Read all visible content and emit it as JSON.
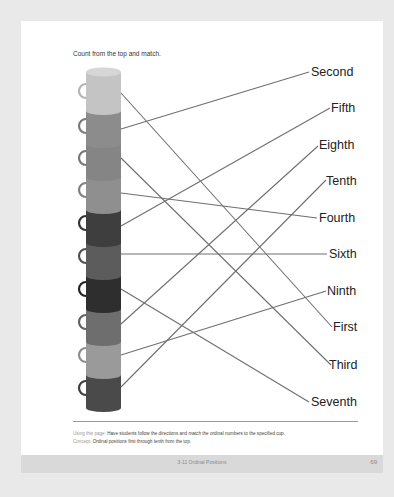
{
  "page": {
    "instruction": "Count from the top and match.",
    "cups": [
      {
        "position": 1,
        "color": "#c4c4c4"
      },
      {
        "position": 2,
        "color": "#8c8c8c"
      },
      {
        "position": 3,
        "color": "#858585"
      },
      {
        "position": 4,
        "color": "#8f8f8f"
      },
      {
        "position": 5,
        "color": "#3e3e3e"
      },
      {
        "position": 6,
        "color": "#5c5c5c"
      },
      {
        "position": 7,
        "color": "#2e2e2e"
      },
      {
        "position": 8,
        "color": "#6e6e6e"
      },
      {
        "position": 9,
        "color": "#9a9a9a"
      },
      {
        "position": 10,
        "color": "#4a4a4a"
      }
    ],
    "labels": [
      "Second",
      "Fifth",
      "Eighth",
      "Tenth",
      "Fourth",
      "Sixth",
      "Ninth",
      "First",
      "Third",
      "Seventh"
    ],
    "matches": [
      {
        "cup": 1,
        "label": "First"
      },
      {
        "cup": 2,
        "label": "Second"
      },
      {
        "cup": 3,
        "label": "Third"
      },
      {
        "cup": 4,
        "label": "Fourth"
      },
      {
        "cup": 5,
        "label": "Fifth"
      },
      {
        "cup": 6,
        "label": "Sixth"
      },
      {
        "cup": 7,
        "label": "Seventh"
      },
      {
        "cup": 8,
        "label": "Eighth"
      },
      {
        "cup": 9,
        "label": "Ninth"
      },
      {
        "cup": 10,
        "label": "Tenth"
      }
    ],
    "notes": {
      "using_key": "Using this page:",
      "using_text": " Have students follow the directions and match the ordinal numbers to the specified cup.",
      "concept_key": "Concept:",
      "concept_text": " Ordinal positions first through tenth from the top."
    }
  },
  "footer": {
    "title": "3-11 Ordinal Positions",
    "page_number": "69"
  },
  "colors": {
    "line": "#6f6f6f",
    "page_bg": "#ffffff",
    "outer_bg": "#e9e9e9",
    "footer_band": "#d9d9d9"
  }
}
